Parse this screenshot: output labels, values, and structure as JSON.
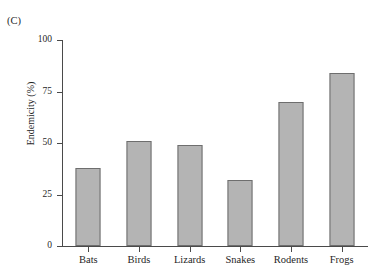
{
  "figure": {
    "clipped_title": "Endemism index",
    "panel_label": "(C)"
  },
  "chart_data": {
    "type": "bar",
    "title": "",
    "xlabel": "",
    "ylabel": "Endemicity (%)",
    "categories": [
      "Bats",
      "Birds",
      "Lizards",
      "Snakes",
      "Rodents",
      "Frogs"
    ],
    "values": [
      38,
      51,
      49,
      32,
      70,
      84
    ],
    "ylim": [
      0,
      100
    ],
    "yticks": [
      0,
      25,
      50,
      75,
      100
    ],
    "ytick_labels": [
      "0",
      "25",
      "50",
      "75",
      "100"
    ],
    "grid": false,
    "legend": null,
    "bar_color": "#b4b4b4",
    "bar_edge_color": "#6e6e6e",
    "axis_color": "#4a4a4a"
  }
}
